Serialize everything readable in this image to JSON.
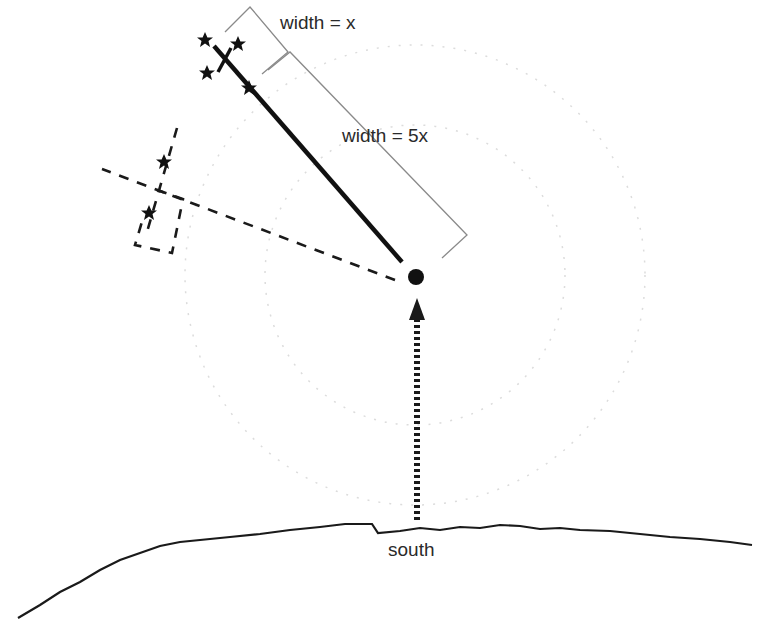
{
  "labels": {
    "width_x": "width = x",
    "width_5x": "width = 5x",
    "south": "south"
  },
  "colors": {
    "ink": "#1a1a1a",
    "bracket": "#8a8a8a",
    "faint_circle": "#d6d6d6"
  }
}
